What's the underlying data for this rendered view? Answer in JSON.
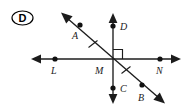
{
  "figure": {
    "choice_label": "D",
    "background_color": "#ffffff",
    "ink_color": "#1c1c1c",
    "width": 193,
    "height": 109,
    "points": [
      {
        "id": "A",
        "label": "A",
        "x": 80,
        "y": 25,
        "label_x": 72,
        "label_y": 39
      },
      {
        "id": "D",
        "label": "D",
        "x": 113,
        "y": 26,
        "label_x": 120,
        "label_y": 26
      },
      {
        "id": "L",
        "label": "L",
        "x": 55,
        "y": 59,
        "label_x": 51,
        "label_y": 74
      },
      {
        "id": "M",
        "label": "M",
        "x": 113,
        "y": 59,
        "label_x": 95,
        "label_y": 74
      },
      {
        "id": "N",
        "label": "N",
        "x": 160,
        "y": 59,
        "label_x": 156,
        "label_y": 74
      },
      {
        "id": "C",
        "label": "C",
        "x": 113,
        "y": 88,
        "label_x": 120,
        "label_y": 92
      },
      {
        "id": "B",
        "label": "B",
        "x": 142,
        "y": 85,
        "label_x": 138,
        "label_y": 101
      }
    ],
    "lines": [
      {
        "id": "horizontal-line",
        "name": "line-LN",
        "x1": 32,
        "y1": 59,
        "x2": 180,
        "y2": 59
      },
      {
        "id": "vertical-line",
        "name": "line-DC",
        "x1": 113,
        "y1": 13,
        "x2": 113,
        "y2": 103
      },
      {
        "id": "diagonal-line",
        "name": "line-AB",
        "x1": 62,
        "y1": 14,
        "x2": 164,
        "y2": 102
      }
    ],
    "tick_marks": [
      {
        "id": "tick-MA",
        "segment": "MA",
        "x": 93,
        "y": 44
      },
      {
        "id": "tick-MB",
        "segment": "MB",
        "x": 126,
        "y": 70
      }
    ],
    "right_angle": {
      "id": "right-angle-marker",
      "vertex_x": 113,
      "vertex_y": 59,
      "quadrant": "upper-right",
      "size": 9
    }
  }
}
